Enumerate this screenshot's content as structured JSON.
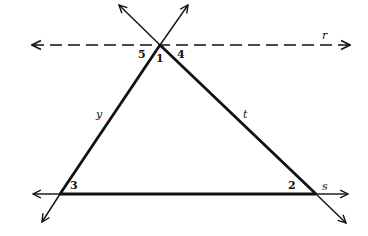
{
  "diagram": {
    "lines": {
      "r": {
        "label": "r",
        "style": "dashed"
      },
      "s": {
        "label": "s",
        "style": "solid"
      },
      "t": {
        "label": "t",
        "style": "solid"
      },
      "y": {
        "label": "y",
        "style": "solid"
      }
    },
    "angles": {
      "a1": "1",
      "a2": "2",
      "a3": "3",
      "a4": "4",
      "a5": "5"
    },
    "colors": {
      "stroke": "#111111",
      "background": "#ffffff"
    }
  }
}
